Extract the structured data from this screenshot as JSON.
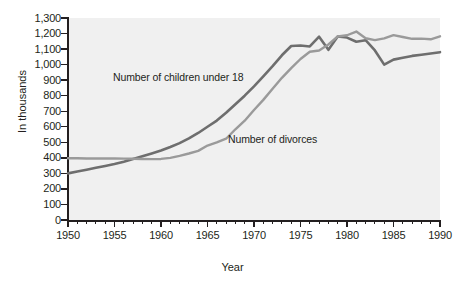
{
  "chart_data": {
    "type": "line",
    "title": "",
    "xlabel": "Year",
    "ylabel": "In thousands",
    "xlim": [
      1950,
      1990
    ],
    "ylim": [
      0,
      1300
    ],
    "grid": false,
    "legend_position": "inline-annotation",
    "x_major_ticks": [
      1950,
      1955,
      1960,
      1965,
      1970,
      1975,
      1980,
      1985,
      1990
    ],
    "x_minor_tick_step": 1,
    "y_ticks": [
      0,
      100,
      200,
      300,
      400,
      500,
      600,
      700,
      800,
      900,
      1000,
      1100,
      1200,
      1300
    ],
    "y_tick_labels": [
      "0",
      "100",
      "200",
      "300",
      "400",
      "500",
      "600",
      "700",
      "800",
      "900",
      "1,000",
      "1,100",
      "1,200",
      "1,300"
    ],
    "x": [
      1950,
      1951,
      1952,
      1953,
      1954,
      1955,
      1956,
      1957,
      1958,
      1959,
      1960,
      1961,
      1962,
      1963,
      1964,
      1965,
      1966,
      1967,
      1968,
      1969,
      1970,
      1971,
      1972,
      1973,
      1974,
      1975,
      1976,
      1977,
      1978,
      1979,
      1980,
      1981,
      1982,
      1983,
      1984,
      1985,
      1986,
      1987,
      1988,
      1989,
      1990
    ],
    "series": [
      {
        "name": "Number of children under 18",
        "color": "#6e6e6e",
        "annotation": "Number of children under 18",
        "values": [
          300,
          312,
          324,
          336,
          348,
          360,
          375,
          392,
          410,
          428,
          447,
          470,
          495,
          525,
          560,
          600,
          640,
          690,
          745,
          800,
          860,
          925,
          990,
          1060,
          1120,
          1123,
          1117,
          1180,
          1095,
          1181,
          1174,
          1147,
          1157,
          1091,
          1000,
          1032,
          1044,
          1056,
          1064,
          1072,
          1080
        ]
      },
      {
        "name": "Number of divorces",
        "color": "#9a9a9a",
        "annotation": "Number of divorces",
        "values": [
          397,
          397,
          396,
          396,
          396,
          396,
          395,
          394,
          393,
          392,
          393,
          400,
          413,
          428,
          445,
          479,
          499,
          523,
          584,
          639,
          708,
          773,
          845,
          915,
          977,
          1036,
          1083,
          1091,
          1130,
          1181,
          1189,
          1213,
          1170,
          1158,
          1169,
          1190,
          1178,
          1166,
          1167,
          1163,
          1182
        ]
      }
    ]
  }
}
